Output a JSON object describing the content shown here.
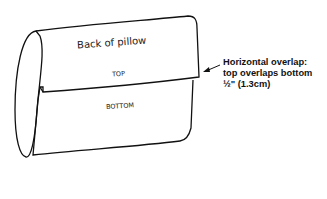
{
  "diagram": {
    "title": "Back of pillow",
    "top_label": "TOP",
    "bottom_label": "BOTTOM",
    "annotation": {
      "line1": "Horizontal overlap:",
      "line2": "top overlaps bottom",
      "line3": "½\" (1.3cm)"
    },
    "colors": {
      "stroke": "#111111",
      "background": "#ffffff"
    }
  }
}
